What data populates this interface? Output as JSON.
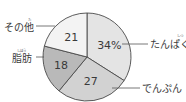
{
  "chart_data": {
    "type": "pie",
    "title": "",
    "start": "top",
    "direction": "clockwise",
    "slices": [
      {
        "label": "たんぱく質",
        "ruby": "しつ",
        "value": 34,
        "value_label": "34%",
        "color": "#e4e4e4"
      },
      {
        "label": "でんぷん",
        "ruby": "",
        "value": 27,
        "value_label": "27",
        "color": "#d2d2d2"
      },
      {
        "label": "脂肪",
        "ruby": "しぼう",
        "value": 18,
        "value_label": "18",
        "color": "#b9b9b9"
      },
      {
        "label": "その他",
        "ruby": "た",
        "value": 21,
        "value_label": "21",
        "color": "#f3f3f3"
      }
    ],
    "unit": "%"
  }
}
